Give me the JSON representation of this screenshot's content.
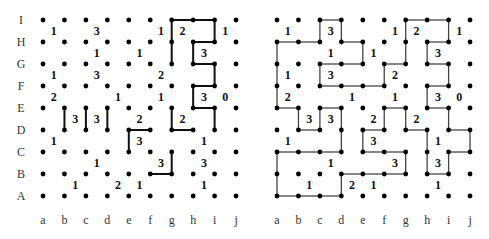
{
  "columns": [
    "a",
    "b",
    "c",
    "d",
    "e",
    "f",
    "g",
    "h",
    "i",
    "j"
  ],
  "rows": [
    "I",
    "H",
    "G",
    "F",
    "E",
    "D",
    "C",
    "B",
    "A"
  ],
  "colors": {
    "dot": "#000000",
    "line_left": "#111111",
    "line_right": "#444444",
    "text": "#111111"
  },
  "clues": [
    {
      "col": "a",
      "row": "I",
      "value": "1"
    },
    {
      "col": "c",
      "row": "I",
      "value": "3"
    },
    {
      "col": "f",
      "row": "I",
      "value": "1"
    },
    {
      "col": "g",
      "row": "I",
      "value": "2"
    },
    {
      "col": "i",
      "row": "I",
      "value": "1"
    },
    {
      "col": "c",
      "row": "H",
      "value": "1"
    },
    {
      "col": "e",
      "row": "H",
      "value": "1"
    },
    {
      "col": "h",
      "row": "H",
      "value": "3"
    },
    {
      "col": "a",
      "row": "G",
      "value": "1"
    },
    {
      "col": "c",
      "row": "G",
      "value": "3"
    },
    {
      "col": "f",
      "row": "G",
      "value": "2"
    },
    {
      "col": "a",
      "row": "F",
      "value": "2"
    },
    {
      "col": "d",
      "row": "F",
      "value": "1"
    },
    {
      "col": "f",
      "row": "F",
      "value": "1"
    },
    {
      "col": "h",
      "row": "F",
      "value": "3"
    },
    {
      "col": "i",
      "row": "F",
      "value": "0"
    },
    {
      "col": "b",
      "row": "E",
      "value": "3"
    },
    {
      "col": "c",
      "row": "E",
      "value": "3"
    },
    {
      "col": "e",
      "row": "E",
      "value": "2"
    },
    {
      "col": "g",
      "row": "E",
      "value": "2"
    },
    {
      "col": "a",
      "row": "D",
      "value": "1"
    },
    {
      "col": "e",
      "row": "D",
      "value": "3"
    },
    {
      "col": "h",
      "row": "D",
      "value": "1"
    },
    {
      "col": "c",
      "row": "C",
      "value": "1"
    },
    {
      "col": "f",
      "row": "C",
      "value": "3"
    },
    {
      "col": "h",
      "row": "C",
      "value": "3"
    },
    {
      "col": "b",
      "row": "B",
      "value": "1"
    },
    {
      "col": "d",
      "row": "B",
      "value": "2"
    },
    {
      "col": "e",
      "row": "B",
      "value": "1"
    },
    {
      "col": "h",
      "row": "B",
      "value": "1"
    }
  ],
  "puzzles": [
    {
      "name": "partial-solution",
      "origin_x": 43,
      "show_row_labels": true,
      "segments": [
        [
          "gI",
          "hI"
        ],
        [
          "hI",
          "iI"
        ],
        [
          "gI",
          "gH"
        ],
        [
          "gH",
          "gG"
        ],
        [
          "iI",
          "iH"
        ],
        [
          "hH",
          "iH"
        ],
        [
          "hH",
          "hG"
        ],
        [
          "hG",
          "iG"
        ],
        [
          "iG",
          "iF"
        ],
        [
          "hF",
          "iF"
        ],
        [
          "hF",
          "hE"
        ],
        [
          "hE",
          "iE"
        ],
        [
          "iE",
          "iD"
        ],
        [
          "gE",
          "gD"
        ],
        [
          "gD",
          "hD"
        ],
        [
          "bE",
          "bD"
        ],
        [
          "cE",
          "cD"
        ],
        [
          "dE",
          "dD"
        ],
        [
          "eD",
          "fD"
        ],
        [
          "eD",
          "eC"
        ],
        [
          "gC",
          "gB"
        ],
        [
          "fB",
          "gB"
        ]
      ]
    },
    {
      "name": "full-solution",
      "origin_x": 277,
      "show_row_labels": false,
      "segments": [
        [
          "cI",
          "dI"
        ],
        [
          "cI",
          "cH"
        ],
        [
          "dI",
          "dH"
        ],
        [
          "aH",
          "bH"
        ],
        [
          "bH",
          "cH"
        ],
        [
          "dH",
          "eH"
        ],
        [
          "eH",
          "eG"
        ],
        [
          "aH",
          "aG"
        ],
        [
          "aG",
          "aF"
        ],
        [
          "aF",
          "aE"
        ],
        [
          "cG",
          "dG"
        ],
        [
          "dG",
          "eG"
        ],
        [
          "cG",
          "cF"
        ],
        [
          "cF",
          "dF"
        ],
        [
          "dF",
          "eF"
        ],
        [
          "eF",
          "fF"
        ],
        [
          "fF",
          "fG"
        ],
        [
          "fG",
          "gG"
        ],
        [
          "gG",
          "gH"
        ],
        [
          "gH",
          "gI"
        ],
        [
          "gI",
          "hI"
        ],
        [
          "hI",
          "iI"
        ],
        [
          "iI",
          "iH"
        ],
        [
          "hH",
          "iH"
        ],
        [
          "hH",
          "hG"
        ],
        [
          "hG",
          "iG"
        ],
        [
          "iG",
          "iF"
        ],
        [
          "hF",
          "iF"
        ],
        [
          "hF",
          "hE"
        ],
        [
          "hE",
          "iE"
        ],
        [
          "iE",
          "iD"
        ],
        [
          "iD",
          "jD"
        ],
        [
          "jD",
          "jC"
        ],
        [
          "iC",
          "jC"
        ],
        [
          "iC",
          "iB"
        ],
        [
          "hB",
          "iB"
        ],
        [
          "hB",
          "hC"
        ],
        [
          "hC",
          "hD"
        ],
        [
          "gD",
          "hD"
        ],
        [
          "gD",
          "gE"
        ],
        [
          "fE",
          "gE"
        ],
        [
          "fE",
          "fD"
        ],
        [
          "eD",
          "fD"
        ],
        [
          "eD",
          "eC"
        ],
        [
          "eC",
          "fC"
        ],
        [
          "fC",
          "gC"
        ],
        [
          "gC",
          "gB"
        ],
        [
          "fB",
          "gB"
        ],
        [
          "eB",
          "fB"
        ],
        [
          "dB",
          "eB"
        ],
        [
          "dB",
          "dA"
        ],
        [
          "cA",
          "dA"
        ],
        [
          "bA",
          "cA"
        ],
        [
          "aA",
          "bA"
        ],
        [
          "aA",
          "aB"
        ],
        [
          "aB",
          "aC"
        ],
        [
          "aC",
          "bC"
        ],
        [
          "bC",
          "cC"
        ],
        [
          "cC",
          "dC"
        ],
        [
          "dC",
          "dD"
        ],
        [
          "dD",
          "dE"
        ],
        [
          "cE",
          "dE"
        ],
        [
          "cE",
          "cD"
        ],
        [
          "bD",
          "cD"
        ],
        [
          "bD",
          "bE"
        ],
        [
          "aE",
          "bE"
        ]
      ]
    }
  ],
  "layout": {
    "top_y": 20,
    "row_spacing": 22,
    "col_spacing": 21.45,
    "row_label_x": 21,
    "col_label_y": 224
  }
}
